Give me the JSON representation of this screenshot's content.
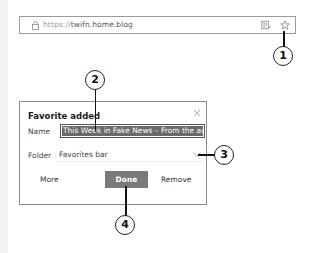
{
  "browser": {
    "address_bar": {
      "protocol": "https://",
      "domain": "twifn.home.blog",
      "icons": [
        "lock-icon",
        "reading-view-icon",
        "star-icon"
      ]
    }
  },
  "favorite_dialog": {
    "title": "Favorite added",
    "close_icon": "close-icon",
    "name_label": "Name",
    "name_value": "This Week in Fake News – From the autho",
    "folder_label": "Folder",
    "folder_value": "Favorites bar",
    "folder_icon": "chevron-down-icon",
    "buttons": {
      "more": "More",
      "done": "Done",
      "remove": "Remove"
    },
    "colors": {
      "done_button_bg": "#7a7a7a",
      "name_selection_bg": "#6a6a6a"
    }
  },
  "callouts": [
    {
      "number": "1",
      "target": "star-icon"
    },
    {
      "number": "2",
      "target": "name-input"
    },
    {
      "number": "3",
      "target": "folder-select"
    },
    {
      "number": "4",
      "target": "done-button"
    }
  ]
}
